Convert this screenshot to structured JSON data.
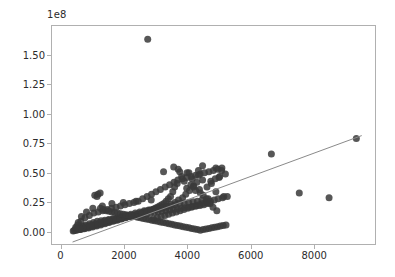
{
  "chart_data": {
    "type": "scatter",
    "title": "",
    "xlabel": "",
    "ylabel": "",
    "y_offset_text": "1e8",
    "y_offset_factor": 100000000,
    "grid": false,
    "legend": null,
    "xlim": [
      -300,
      9950
    ],
    "ylim": [
      -11000000,
      175000000
    ],
    "xticks": [
      0,
      2000,
      4000,
      6000,
      8000
    ],
    "xticklabels": [
      "0",
      "2000",
      "4000",
      "6000",
      "8000"
    ],
    "yticks": [
      0,
      25000000,
      50000000,
      75000000,
      100000000,
      125000000,
      150000000
    ],
    "yticklabels": [
      "0.00",
      "0.25",
      "0.50",
      "0.75",
      "1.00",
      "1.25",
      "1.50"
    ],
    "marker": {
      "shape": "circle",
      "size_px": 7,
      "color": "#3a3a3a",
      "alpha": 0.85
    },
    "trendline": {
      "type": "linear",
      "color": "#8a8a8a",
      "width": 1,
      "x_start": 380,
      "y_start": -8500000,
      "x_end": 9500,
      "y_end": 81500000
    },
    "series": [
      {
        "name": "observations",
        "x": [
          2750,
          9330,
          6650,
          7530,
          8470,
          5000,
          5080,
          4760,
          4620,
          4900,
          4480,
          4350,
          4200,
          4380,
          4500,
          4660,
          4300,
          4150,
          4050,
          3980,
          4720,
          4810,
          4930,
          5150,
          4610,
          4410,
          4260,
          4110,
          3900,
          3820,
          3760,
          3680,
          3600,
          3540,
          3470,
          3400,
          3330,
          3260,
          3190,
          3120,
          3050,
          2980,
          2910,
          2840,
          2770,
          2700,
          2630,
          2560,
          2490,
          2420,
          2350,
          2280,
          2210,
          2140,
          2070,
          2000,
          1930,
          1860,
          1790,
          1720,
          1650,
          1580,
          1510,
          1440,
          1370,
          1300,
          1230,
          1160,
          1090,
          1020,
          950,
          880,
          810,
          740,
          670,
          600,
          530,
          470,
          430,
          400,
          3850,
          3720,
          3950,
          4070,
          4190,
          3610,
          3480,
          3350,
          3220,
          3090,
          2960,
          2830,
          2700,
          2570,
          2440,
          2310,
          2180,
          2050,
          1920,
          1790,
          1660,
          1530,
          1400,
          1270,
          1140,
          1010,
          880,
          750,
          620,
          520,
          4640,
          4520,
          4400,
          4280,
          4160,
          4040,
          3920,
          3800,
          3680,
          3560,
          3440,
          3320,
          3200,
          3080,
          2960,
          2840,
          2720,
          2600,
          2480,
          2360,
          2240,
          2120,
          2000,
          1880,
          1760,
          1640,
          1520,
          1400,
          1280,
          1160,
          1040,
          920,
          800,
          680,
          580,
          490,
          3300,
          3440,
          3580,
          3700,
          3840,
          3980,
          4120,
          4260,
          4400,
          4540,
          4680,
          4820,
          4960,
          5090,
          3150,
          3010,
          2870,
          2730,
          2590,
          2450,
          2310,
          2170,
          2030,
          1890,
          1750,
          1610,
          1470,
          1330,
          1190,
          1050,
          910,
          770,
          640,
          540,
          4740,
          4880,
          5020,
          4600,
          4460,
          4320,
          4180,
          4040,
          3900,
          3760,
          3620,
          3480,
          3340,
          3200,
          3060,
          2920,
          2780,
          2640,
          2500,
          2360,
          2220,
          2080,
          1940,
          1800,
          1660,
          1520,
          1380,
          1240,
          1100,
          960,
          820,
          700,
          600,
          1080,
          1180,
          1260,
          1350,
          1440,
          1530,
          1620,
          1710,
          1800,
          1890,
          1980,
          2070,
          2160,
          2250,
          2340,
          2430,
          2520,
          2610,
          2700,
          2790,
          2880,
          2970,
          3060,
          3150,
          3240,
          3330,
          3420,
          3510,
          3600,
          3690,
          3780,
          3870,
          3960,
          4050,
          4140,
          4230,
          4320,
          4410,
          4500,
          4590,
          4680,
          4770,
          4860,
          4950,
          5040,
          5130,
          5220,
          1150,
          1250,
          3570,
          3710,
          3250,
          4480,
          4900,
          5200,
          4350,
          3990,
          2860,
          2380,
          1980,
          1620,
          1320,
          1020,
          820,
          660,
          560,
          480,
          3410,
          3530,
          3650,
          3770,
          3890,
          4010,
          4130,
          4250,
          4370,
          4490,
          4610,
          4730,
          4850,
          4970,
          5110,
          5260,
          3290,
          3170,
          3050,
          2930
        ],
        "y": [
          163000000,
          79000000,
          66000000,
          33000000,
          29000000,
          46000000,
          52000000,
          41000000,
          38000000,
          34000000,
          44000000,
          48000000,
          39000000,
          36000000,
          31000000,
          28000000,
          42000000,
          45000000,
          50000000,
          37000000,
          24000000,
          21000000,
          18000000,
          30000000,
          26000000,
          33000000,
          35000000,
          40000000,
          43000000,
          47000000,
          51000000,
          41000000,
          38000000,
          34000000,
          30000000,
          28000000,
          26000000,
          24000000,
          23000000,
          22000000,
          21000000,
          20000000,
          19000000,
          18500000,
          18000000,
          17500000,
          17000000,
          16000000,
          15500000,
          15000000,
          14500000,
          14000000,
          13500000,
          13000000,
          12500000,
          12000000,
          11500000,
          11000000,
          10500000,
          10000000,
          9500000,
          9000000,
          8500000,
          8000000,
          7500000,
          7000000,
          6500000,
          6000000,
          5500000,
          5000000,
          4500000,
          4000000,
          3500000,
          3000000,
          2600000,
          2200000,
          1800000,
          1500000,
          1200000,
          900000,
          29000000,
          27000000,
          32000000,
          35000000,
          38000000,
          25000000,
          23500000,
          22000000,
          21000000,
          20000000,
          19000000,
          18000000,
          17000000,
          16000000,
          15000000,
          14000000,
          13000000,
          12000000,
          11000000,
          10000000,
          9000000,
          8000000,
          7000000,
          6000000,
          5000000,
          4200000,
          3400000,
          2800000,
          2200000,
          1600000,
          24000000,
          23000000,
          22500000,
          22000000,
          21500000,
          21000000,
          20500000,
          20000000,
          19500000,
          19000000,
          18500000,
          18000000,
          17500000,
          17000000,
          16500000,
          16000000,
          15500000,
          15000000,
          14500000,
          14000000,
          13500000,
          13000000,
          12500000,
          12000000,
          11500000,
          11000000,
          10500000,
          10000000,
          9500000,
          9000000,
          8000000,
          7000000,
          6000000,
          5000000,
          4000000,
          3000000,
          38000000,
          40000000,
          42000000,
          44000000,
          45000000,
          46000000,
          47000000,
          48000000,
          49000000,
          50000000,
          51000000,
          52000000,
          53000000,
          54000000,
          36000000,
          34000000,
          32000000,
          30000000,
          28000000,
          26000000,
          25000000,
          24000000,
          23000000,
          22000000,
          21000000,
          20000000,
          19000000,
          18000000,
          17000000,
          16000000,
          14000000,
          12000000,
          9000000,
          6000000,
          43000000,
          45000000,
          47000000,
          28000000,
          27000000,
          26000000,
          25500000,
          25000000,
          24500000,
          24000000,
          23000000,
          22000000,
          21000000,
          20000000,
          19500000,
          19000000,
          18500000,
          18000000,
          17000000,
          16000000,
          15000000,
          14000000,
          13000000,
          12000000,
          11000000,
          10000000,
          9000000,
          8000000,
          7000000,
          6000000,
          5000000,
          4000000,
          3000000,
          31000000,
          32000000,
          20000000,
          19000000,
          18000000,
          17500000,
          17000000,
          16500000,
          16000000,
          15500000,
          15000000,
          14500000,
          14000000,
          13500000,
          13000000,
          12500000,
          12000000,
          11500000,
          11000000,
          10500000,
          10000000,
          9500000,
          9000000,
          8500000,
          8000000,
          7500000,
          7000000,
          6500000,
          6000000,
          5500000,
          5000000,
          4500000,
          4000000,
          3500000,
          3000000,
          2500000,
          2000000,
          1500000,
          2000000,
          2500000,
          3000000,
          3500000,
          4000000,
          4500000,
          5000000,
          5500000,
          6000000,
          30000000,
          33000000,
          55000000,
          53000000,
          51000000,
          56000000,
          54000000,
          49000000,
          52000000,
          50000000,
          27000000,
          26000000,
          25000000,
          24000000,
          22000000,
          20000000,
          17000000,
          13000000,
          8000000,
          4000000,
          15000000,
          16000000,
          17000000,
          18000000,
          19000000,
          20000000,
          21000000,
          22000000,
          23000000,
          24000000,
          25000000,
          26000000,
          27000000,
          28000000,
          29000000,
          30000000,
          14000000,
          13000000,
          12000000,
          11000000
        ]
      }
    ]
  }
}
